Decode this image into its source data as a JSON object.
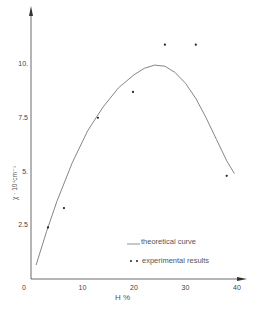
{
  "chart_data": {
    "type": "scatter",
    "title": "",
    "xlabel": "H %",
    "ylabel": "χ · 10⁴cm⁻¹",
    "xlim": [
      0,
      40
    ],
    "ylim": [
      0,
      12
    ],
    "x_ticks": [
      "0",
      "10",
      "20",
      "30",
      "40"
    ],
    "y_ticks": [
      "2.5",
      "5.",
      "7.5",
      "10."
    ],
    "grid": false,
    "legend_position": "lower right",
    "series": [
      {
        "name": "theoretical curve",
        "type": "line",
        "x": [
          1,
          3,
          5,
          8,
          11,
          14,
          17,
          20,
          22,
          24,
          26,
          28,
          30,
          32,
          34,
          36,
          38,
          39.5
        ],
        "y": [
          0.65,
          2.2,
          3.6,
          5.4,
          6.9,
          8.0,
          8.9,
          9.5,
          9.8,
          9.95,
          9.9,
          9.6,
          9.1,
          8.4,
          7.5,
          6.5,
          5.5,
          4.9
        ]
      },
      {
        "name": "experimental results",
        "type": "scatter",
        "x": [
          3.3,
          6.4,
          13.0,
          19.8,
          26.0,
          32.0,
          38.0
        ],
        "y": [
          2.4,
          3.3,
          7.5,
          8.7,
          10.9,
          10.9,
          4.8
        ]
      }
    ]
  },
  "axes": {
    "origin_label": "0",
    "x_ticks": [
      {
        "label": "10",
        "value": 10
      },
      {
        "label": "20",
        "value": 20
      },
      {
        "label": "30",
        "value": 30
      },
      {
        "label": "40",
        "value": 40
      }
    ],
    "y_ticks": [
      {
        "label": "2.5",
        "value": 2.5
      },
      {
        "label": "5.",
        "value": 5
      },
      {
        "label": "7.5",
        "value": 7.5
      },
      {
        "label": "10.",
        "value": 10
      }
    ],
    "xlabel": "H %",
    "ylabel": "χ · 10⁴cm⁻¹"
  },
  "legend": {
    "line_label": "theoretical curve",
    "dots_label": "experimental results"
  }
}
